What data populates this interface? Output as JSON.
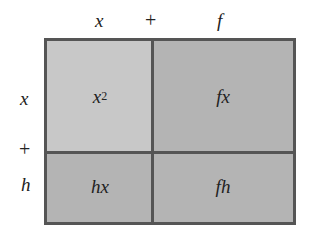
{
  "diagram": {
    "top_labels": {
      "left": "x",
      "operator": "+",
      "right": "f"
    },
    "side_labels": {
      "top": "x",
      "operator": "+",
      "bottom": "h"
    },
    "cells": {
      "top_left": {
        "base": "x",
        "exponent": "2",
        "color": "#c8c8c8"
      },
      "top_right": {
        "text": "fx",
        "color": "#b4b4b4"
      },
      "bottom_left": {
        "text": "hx",
        "color": "#b4b4b4"
      },
      "bottom_right": {
        "text": "fh",
        "color": "#b4b4b4"
      }
    },
    "border_color": "#555555"
  }
}
